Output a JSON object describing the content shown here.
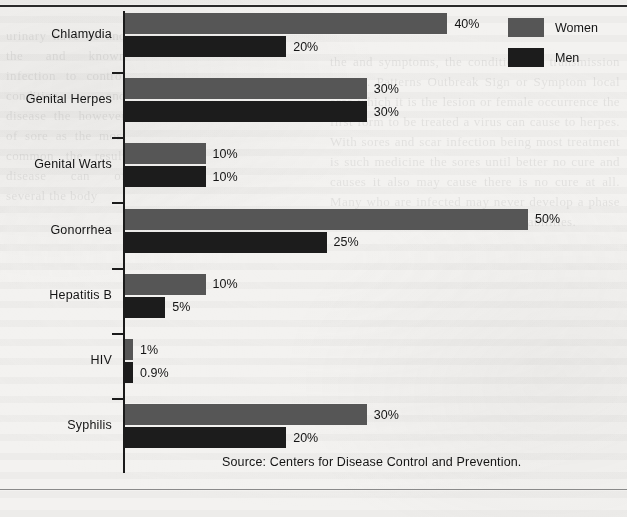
{
  "chart_data": {
    "type": "bar",
    "orientation": "horizontal",
    "title": "",
    "xlabel": "",
    "ylabel": "",
    "xlim": [
      0,
      50
    ],
    "grid": false,
    "categories": [
      "Chlamydia",
      "Genital Herpes",
      "Genital Warts",
      "Gonorrhea",
      "Hepatitis B",
      "HIV",
      "Syphilis"
    ],
    "series": [
      {
        "name": "Women",
        "color": "#565656",
        "values": [
          40,
          30,
          10,
          50,
          10,
          1,
          30
        ],
        "labels": [
          "40%",
          "30%",
          "10%",
          "50%",
          "10%",
          "1%",
          "30%"
        ]
      },
      {
        "name": "Men",
        "color": "#1c1c1c",
        "values": [
          20,
          30,
          10,
          25,
          5,
          0.9,
          20
        ],
        "labels": [
          "20%",
          "30%",
          "10%",
          "25%",
          "5%",
          "0.9%",
          "20%"
        ]
      }
    ],
    "legend_position": "top-right",
    "value_unit": "%"
  },
  "legend": {
    "items": [
      {
        "label": "Women",
        "swatch": "women"
      },
      {
        "label": "Men",
        "swatch": "men"
      }
    ]
  },
  "source": {
    "text": "Source:  Centers for Disease Control and Prevention."
  },
  "ghost": {
    "right": "the and symptoms, the conditions of transmission person. Patterns Outbreak Sign or Symptom local area which it is the lesion or female occurrence the first form to be treated a virus can cause to herpes. With sores and scar infection being most treatment is such medicine the sores until better no cure and causes it also may cause there is no cure at all. Many who are infected may never develop a phase of a period of years may lead to disabilities.",
    "left": "urinary have be and the and known infection to control condition and disease the however of sore as the most common the result disease can of several the body"
  }
}
